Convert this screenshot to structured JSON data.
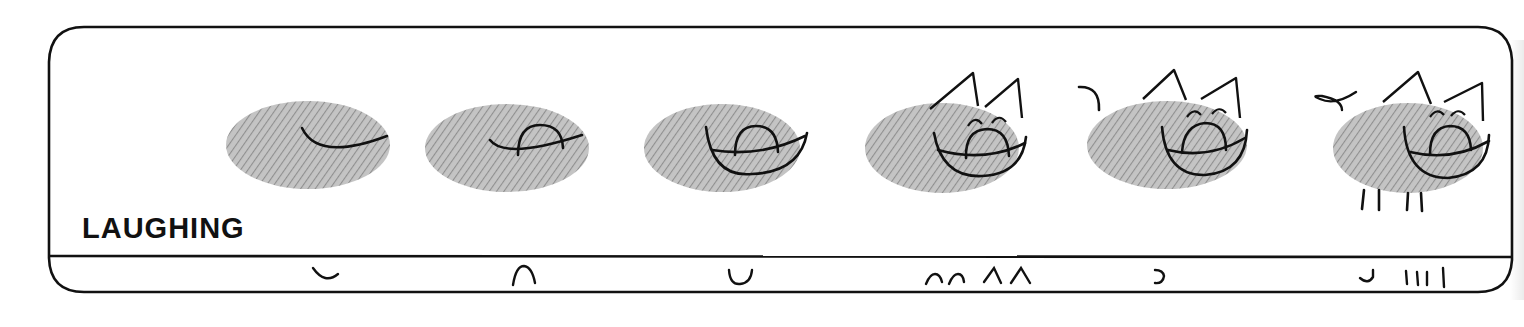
{
  "panel": {
    "title": "LAUGHING",
    "colors": {
      "ink": "#111111",
      "print_fill": "#b8b8b8",
      "print_ridge": "#8e8e8e",
      "paper": "#ffffff"
    }
  },
  "steps": [
    {
      "index": 1,
      "description": "fingerprint with smile curve",
      "stroke_key": "◡"
    },
    {
      "index": 2,
      "description": "add tongue arc",
      "stroke_key": "∩"
    },
    {
      "index": 3,
      "description": "add lower mouth curve",
      "stroke_key": "∪"
    },
    {
      "index": 4,
      "description": "add closed eyes and ears",
      "stroke_key": "∩∩ ∧∧"
    },
    {
      "index": 5,
      "description": "add tail",
      "stroke_key": "ɔ"
    },
    {
      "index": 6,
      "description": "add tail curl and legs",
      "stroke_key": "◡ IIII"
    }
  ]
}
